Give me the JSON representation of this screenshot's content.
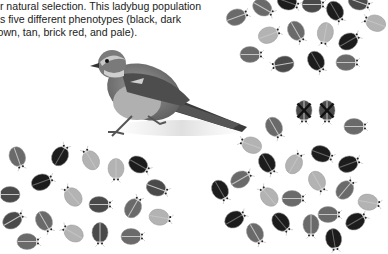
{
  "caption": {
    "lines": [
      "or natural selection. This ladybug population",
      "as five different phenotypes (black, dark",
      "rown, tan, brick red, and pale)."
    ]
  },
  "colors": {
    "black": "#1c1c1c",
    "dark": "#4a4a4a",
    "medium": "#6a6a6a",
    "tan": "#8c8c8c",
    "pale": "#b3b3b3",
    "head": "#d8d8d8",
    "eaten_mark": "#111111"
  },
  "figure": {
    "bird": {
      "name": "sparrow",
      "position": [
        82,
        44
      ]
    },
    "groups": [
      {
        "name": "top-right-population",
        "ladybugs": [
          {
            "x": 226,
            "y": 8,
            "r": -20,
            "shade": "medium"
          },
          {
            "x": 252,
            "y": 0,
            "r": 30,
            "shade": "medium"
          },
          {
            "x": 277,
            "y": -6,
            "r": 20,
            "shade": "black"
          },
          {
            "x": 302,
            "y": -4,
            "r": 0,
            "shade": "dark"
          },
          {
            "x": 324,
            "y": 4,
            "r": 60,
            "shade": "black"
          },
          {
            "x": 348,
            "y": -6,
            "r": 20,
            "shade": "dark"
          },
          {
            "x": 362,
            "y": 14,
            "r": -160,
            "shade": "pale"
          },
          {
            "x": 258,
            "y": 26,
            "r": -20,
            "shade": "pale"
          },
          {
            "x": 285,
            "y": 24,
            "r": 60,
            "shade": "medium"
          },
          {
            "x": 313,
            "y": 26,
            "r": 100,
            "shade": "pale"
          },
          {
            "x": 338,
            "y": 32,
            "r": -30,
            "shade": "black"
          },
          {
            "x": 240,
            "y": 46,
            "r": 0,
            "shade": "medium"
          },
          {
            "x": 270,
            "y": 56,
            "r": 170,
            "shade": "dark"
          },
          {
            "x": 305,
            "y": 54,
            "r": 60,
            "shade": "black"
          },
          {
            "x": 336,
            "y": 54,
            "r": 0,
            "shade": "medium"
          }
        ]
      },
      {
        "name": "bottom-left-population",
        "ladybugs": [
          {
            "x": 6,
            "y": 150,
            "r": 70,
            "shade": "medium"
          },
          {
            "x": 49,
            "y": 146,
            "r": -60,
            "shade": "black"
          },
          {
            "x": 78,
            "y": 150,
            "r": -120,
            "shade": "pale"
          },
          {
            "x": 104,
            "y": 162,
            "r": 90,
            "shade": "pale"
          },
          {
            "x": 128,
            "y": 157,
            "r": 30,
            "shade": "black"
          },
          {
            "x": 31,
            "y": 173,
            "r": -20,
            "shade": "black"
          },
          {
            "x": -4,
            "y": 186,
            "r": 180,
            "shade": "dark"
          },
          {
            "x": 60,
            "y": 187,
            "r": -130,
            "shade": "pale"
          },
          {
            "x": 89,
            "y": 196,
            "r": 0,
            "shade": "dark"
          },
          {
            "x": 122,
            "y": 198,
            "r": -60,
            "shade": "medium"
          },
          {
            "x": 146,
            "y": 180,
            "r": 20,
            "shade": "dark"
          },
          {
            "x": 2,
            "y": 211,
            "r": -30,
            "shade": "dark"
          },
          {
            "x": 33,
            "y": 214,
            "r": 60,
            "shade": "medium"
          },
          {
            "x": 60,
            "y": 224,
            "r": -150,
            "shade": "pale"
          },
          {
            "x": 88,
            "y": 226,
            "r": 90,
            "shade": "dark"
          },
          {
            "x": 121,
            "y": 228,
            "r": 0,
            "shade": "medium"
          },
          {
            "x": 149,
            "y": 209,
            "r": 10,
            "shade": "pale"
          },
          {
            "x": 17,
            "y": 233,
            "r": 0,
            "shade": "medium"
          }
        ]
      },
      {
        "name": "bottom-right-population",
        "ladybugs": [
          {
            "x": 292,
            "y": 104,
            "r": 90,
            "shade": "dark",
            "eaten": true
          },
          {
            "x": 315,
            "y": 104,
            "r": 90,
            "shade": "dark",
            "eaten": true
          },
          {
            "x": 344,
            "y": 118,
            "r": 0,
            "shade": "medium"
          },
          {
            "x": 263,
            "y": 120,
            "r": 60,
            "shade": "medium"
          },
          {
            "x": 238,
            "y": 136,
            "r": -160,
            "shade": "pale"
          },
          {
            "x": 311,
            "y": 146,
            "r": 20,
            "shade": "black"
          },
          {
            "x": 338,
            "y": 155,
            "r": -20,
            "shade": "black"
          },
          {
            "x": 256,
            "y": 156,
            "r": 60,
            "shade": "black"
          },
          {
            "x": 283,
            "y": 154,
            "r": -60,
            "shade": "pale"
          },
          {
            "x": 230,
            "y": 170,
            "r": -30,
            "shade": "medium"
          },
          {
            "x": 306,
            "y": 174,
            "r": 60,
            "shade": "pale"
          },
          {
            "x": 334,
            "y": 180,
            "r": -50,
            "shade": "medium"
          },
          {
            "x": 209,
            "y": 183,
            "r": 60,
            "shade": "black"
          },
          {
            "x": 256,
            "y": 187,
            "r": -130,
            "shade": "pale"
          },
          {
            "x": 282,
            "y": 190,
            "r": 0,
            "shade": "medium"
          },
          {
            "x": 358,
            "y": 194,
            "r": 10,
            "shade": "pale"
          },
          {
            "x": 224,
            "y": 210,
            "r": -30,
            "shade": "black"
          },
          {
            "x": 270,
            "y": 215,
            "r": 50,
            "shade": "black"
          },
          {
            "x": 299,
            "y": 218,
            "r": 90,
            "shade": "medium"
          },
          {
            "x": 318,
            "y": 206,
            "r": 0,
            "shade": "medium"
          },
          {
            "x": 345,
            "y": 212,
            "r": -30,
            "shade": "black"
          },
          {
            "x": 244,
            "y": 226,
            "r": 60,
            "shade": "medium"
          },
          {
            "x": 322,
            "y": 232,
            "r": 80,
            "shade": "black"
          }
        ]
      }
    ]
  }
}
